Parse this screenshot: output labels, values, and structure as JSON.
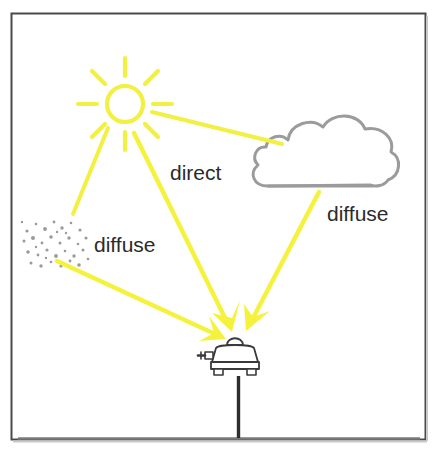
{
  "figure": {
    "frame": {
      "border_color": "#4a4a4a",
      "background_color": "#ffffff",
      "x": 11,
      "y": 13,
      "width": 415,
      "height": 427
    },
    "colors": {
      "sun_ray_yellow": "#F2F042",
      "beam_yellow": "#F5F23E",
      "cloud_gray": "#9b9b9b",
      "aerosol_gray": "#9a9a9a",
      "instrument_outline": "#3a3a3a",
      "pole_color": "#2e2e2e",
      "ground_color": "#6e6e6e",
      "text_color": "#2b2b2b"
    },
    "elements": [
      {
        "name": "sun",
        "kind": "sun-icon",
        "cx": 125,
        "cy": 104,
        "radius": 18,
        "ray_count": 8
      },
      {
        "name": "cloud",
        "kind": "cloud-icon",
        "x": 257,
        "y": 114,
        "width": 140,
        "height": 78
      },
      {
        "name": "aerosol",
        "kind": "aerosol-particles",
        "x": 22,
        "y": 218,
        "width": 68,
        "height": 48,
        "dot_count": 34
      },
      {
        "name": "pyranometer",
        "kind": "pyranometer-icon",
        "x": 203,
        "y": 340,
        "width": 58,
        "height": 40
      },
      {
        "name": "pole",
        "kind": "mounting-pole",
        "x": 238,
        "y": 377,
        "height": 63
      },
      {
        "name": "ground",
        "kind": "ground-line",
        "y": 438
      }
    ],
    "rays": [
      {
        "name": "sun-to-cloud",
        "from": [
          152,
          112
        ],
        "to": [
          281,
          144
        ],
        "arrow": false,
        "label": null
      },
      {
        "name": "sun-to-aerosol",
        "from": [
          108,
          128
        ],
        "to": [
          74,
          213
        ],
        "arrow": false,
        "label": null
      },
      {
        "name": "sun-to-instrument-direct",
        "from": [
          134,
          132
        ],
        "to": [
          230,
          326
        ],
        "arrow": true,
        "label": "direct"
      },
      {
        "name": "cloud-to-instrument-diffuse",
        "from": [
          318,
          192
        ],
        "to": [
          249,
          325
        ],
        "arrow": true,
        "label": "diffuse"
      },
      {
        "name": "aerosol-to-instrument-diffuse",
        "from": [
          58,
          262
        ],
        "to": [
          222,
          337
        ],
        "arrow": true,
        "label": "diffuse"
      }
    ],
    "labels": [
      {
        "id": "direct",
        "text": "direct",
        "x": 170,
        "y": 180,
        "anchor": "start"
      },
      {
        "id": "diffuse_cloud",
        "text": "diffuse",
        "x": 327,
        "y": 221,
        "anchor": "start"
      },
      {
        "id": "diffuse_aerosol",
        "text": "diffuse",
        "x": 94,
        "y": 252,
        "anchor": "start"
      }
    ]
  }
}
